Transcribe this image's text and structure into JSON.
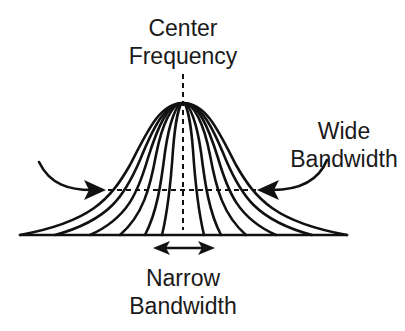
{
  "labels": {
    "center_frequency": {
      "line1": "Center",
      "line2": "Frequency"
    },
    "wide_bandwidth": {
      "line1": "Wide",
      "line2": "Bandwidth"
    },
    "narrow_bandwidth": {
      "line1": "Narrow",
      "line2": "Bandwidth"
    }
  },
  "colors": {
    "stroke": "#111111",
    "background": "#ffffff"
  },
  "diagram": {
    "type": "family of bell curves (filter response)",
    "curve_count": 7,
    "peak": [
      183,
      103
    ],
    "baseline_y": 235,
    "half_power_line_y": 190
  }
}
